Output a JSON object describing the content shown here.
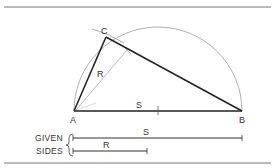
{
  "figure": {
    "type": "geometric-construction",
    "colors": {
      "heavy_line": "#222222",
      "light_line": "#9a9a9a",
      "text": "#333333",
      "border": "#666666"
    },
    "points": {
      "A": {
        "label": "A",
        "x": 74,
        "y": 111
      },
      "B": {
        "label": "B",
        "x": 242,
        "y": 111
      },
      "C": {
        "label": "C",
        "x": 106,
        "y": 37
      }
    },
    "segments": {
      "AB": {
        "label": "S"
      },
      "AC": {
        "label": ""
      },
      "CB": {
        "label": ""
      },
      "R_dimension": {
        "label": "R"
      }
    },
    "semicircle": {
      "center_x": 158,
      "center_y": 111,
      "radius": 84
    },
    "given": {
      "caption_line1": "GIVEN",
      "caption_line2": "SIDES",
      "sides": [
        {
          "label": "S",
          "length_px": 169
        },
        {
          "label": "R",
          "length_px": 74
        }
      ]
    }
  }
}
